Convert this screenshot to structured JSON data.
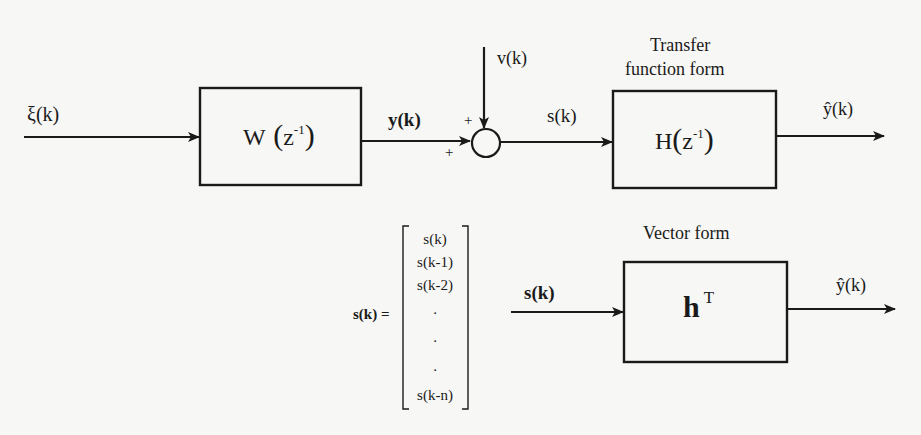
{
  "diagram": {
    "type": "block-diagram",
    "colors": {
      "background": "#f7f7f5",
      "stroke": "#1a1a1a"
    },
    "signals": {
      "input": "ξ(k)",
      "plant_output": "y(k)",
      "noise": "v(k)",
      "sum_output": "s(k)",
      "estimate": "ŷ(k)",
      "vector_input": "s(k)",
      "vector_estimate": "ŷ(k)"
    },
    "sum_signs": {
      "top": "+",
      "left": "+"
    },
    "blocks": {
      "plant": {
        "name": "W",
        "arg": "z",
        "exp": "-1"
      },
      "filter_tf": {
        "name": "H",
        "arg": "z",
        "exp": "-1",
        "title": [
          "Transfer",
          "function form"
        ]
      },
      "filter_vec": {
        "name": "h",
        "exp": "T",
        "title": "Vector form"
      }
    },
    "vector_definition": {
      "lhs": "s(k) =",
      "rows": [
        "s(k)",
        "s(k-1)",
        "s(k-2)",
        ".",
        ".",
        ".",
        "s(k-n)"
      ]
    }
  }
}
